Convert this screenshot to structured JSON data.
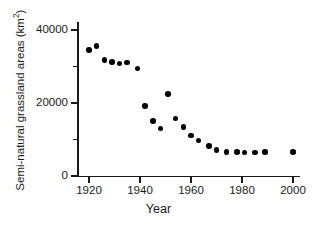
{
  "chart_data": {
    "type": "scatter",
    "title": "",
    "xlabel": "Year",
    "ylabel": "Semi-natural grassland areas (km²)",
    "ylabel_base": "Semi-natural grassland areas (km",
    "ylabel_sup": "2",
    "ylabel_tail": ")",
    "xlim": [
      1912,
      2004
    ],
    "ylim": [
      0,
      42000
    ],
    "grid": false,
    "legend": null,
    "marker": "filled-circle",
    "marker_color": "#000000",
    "x_ticks": [
      1920,
      1940,
      1960,
      1980,
      2000
    ],
    "x_tick_labels": [
      "1920",
      "1940",
      "1960",
      "1980",
      "2000"
    ],
    "y_ticks": [
      0,
      20000,
      40000
    ],
    "y_tick_labels": [
      "0",
      "20000",
      "40000"
    ],
    "y_minor_ticks": [
      10000,
      30000
    ],
    "x": [
      1920,
      1923,
      1926,
      1929,
      1932,
      1935,
      1939,
      1942,
      1945,
      1948,
      1951,
      1954,
      1957,
      1960,
      1963,
      1967,
      1970,
      1974,
      1978,
      1981,
      1985,
      1989,
      2000
    ],
    "y": [
      34500,
      35600,
      31800,
      31300,
      30800,
      31100,
      29400,
      19100,
      15100,
      13000,
      22500,
      15700,
      13500,
      11100,
      9700,
      8200,
      7100,
      6600,
      6500,
      6400,
      6400,
      6500,
      6500
    ],
    "points": [
      {
        "year": 1920,
        "area": 34500
      },
      {
        "year": 1923,
        "area": 35600
      },
      {
        "year": 1926,
        "area": 31800
      },
      {
        "year": 1929,
        "area": 31300
      },
      {
        "year": 1932,
        "area": 30800
      },
      {
        "year": 1935,
        "area": 31100
      },
      {
        "year": 1939,
        "area": 29400
      },
      {
        "year": 1942,
        "area": 19100
      },
      {
        "year": 1945,
        "area": 15100
      },
      {
        "year": 1948,
        "area": 13000
      },
      {
        "year": 1951,
        "area": 22500
      },
      {
        "year": 1954,
        "area": 15700
      },
      {
        "year": 1957,
        "area": 13500
      },
      {
        "year": 1960,
        "area": 11100
      },
      {
        "year": 1963,
        "area": 9700
      },
      {
        "year": 1967,
        "area": 8200
      },
      {
        "year": 1970,
        "area": 7100
      },
      {
        "year": 1974,
        "area": 6600
      },
      {
        "year": 1978,
        "area": 6500
      },
      {
        "year": 1981,
        "area": 6400
      },
      {
        "year": 1985,
        "area": 6400
      },
      {
        "year": 1989,
        "area": 6500
      },
      {
        "year": 2000,
        "area": 6500
      }
    ]
  }
}
